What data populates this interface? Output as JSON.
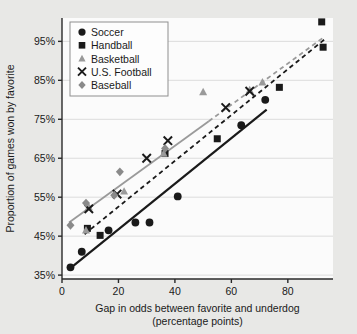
{
  "chart_data": {
    "type": "scatter",
    "title": "",
    "xlabel": "Gap in odds between favorite and underdog (percentage points)",
    "xlabel_line1": "Gap in odds between favorite and underdog",
    "xlabel_line2": "(percentage points)",
    "ylabel": "Proportion of games won by favorite",
    "xlim": [
      0,
      96
    ],
    "ylim": [
      34,
      101
    ],
    "xticks": [
      0,
      20,
      40,
      60,
      80
    ],
    "xtick_labels": [
      "0",
      "20",
      "40",
      "60",
      "80"
    ],
    "yticks": [
      35,
      45,
      55,
      65,
      75,
      85,
      95
    ],
    "ytick_labels": [
      "35%",
      "45%",
      "55%",
      "65%",
      "75%",
      "85%",
      "95%"
    ],
    "grid": "horizontal",
    "legend_position": "top-left",
    "series": [
      {
        "name": "Soccer",
        "marker": "circle",
        "color": "#1a1a1a",
        "points": [
          {
            "x": 3,
            "y": 37
          },
          {
            "x": 7,
            "y": 41
          },
          {
            "x": 16.5,
            "y": 46.5
          },
          {
            "x": 26,
            "y": 48.5
          },
          {
            "x": 31,
            "y": 48.5
          },
          {
            "x": 41,
            "y": 55.2
          },
          {
            "x": 63.5,
            "y": 73.5
          },
          {
            "x": 72,
            "y": 80
          }
        ]
      },
      {
        "name": "Handball",
        "marker": "square",
        "color": "#1a1a1a",
        "points": [
          {
            "x": 9,
            "y": 47
          },
          {
            "x": 13.5,
            "y": 45.2
          },
          {
            "x": 36.5,
            "y": 66.2
          },
          {
            "x": 55,
            "y": 70
          },
          {
            "x": 77,
            "y": 83.2
          },
          {
            "x": 92,
            "y": 100
          },
          {
            "x": 92.5,
            "y": 93.5
          }
        ]
      },
      {
        "name": "Basketball",
        "marker": "triangle",
        "color": "#9a9a9a",
        "points": [
          {
            "x": 8.5,
            "y": 46.5
          },
          {
            "x": 9.5,
            "y": 52.5
          },
          {
            "x": 22,
            "y": 56.5
          },
          {
            "x": 36,
            "y": 66.2
          },
          {
            "x": 50,
            "y": 82
          },
          {
            "x": 66.5,
            "y": 82.5
          },
          {
            "x": 71,
            "y": 84.5
          }
        ]
      },
      {
        "name": "U.S. Football",
        "marker": "cross",
        "color": "#1a1a1a",
        "points": [
          {
            "x": 9.5,
            "y": 52
          },
          {
            "x": 19.5,
            "y": 55.8
          },
          {
            "x": 30,
            "y": 65
          },
          {
            "x": 37.5,
            "y": 69.5
          },
          {
            "x": 58,
            "y": 78
          },
          {
            "x": 66.5,
            "y": 82.2
          }
        ]
      },
      {
        "name": "Baseball",
        "marker": "diamond",
        "color": "#8a8a8a",
        "points": [
          {
            "x": 3,
            "y": 47.8
          },
          {
            "x": 8.5,
            "y": 53.5
          },
          {
            "x": 18.5,
            "y": 55.5
          },
          {
            "x": 20.5,
            "y": 61.5
          },
          {
            "x": 36.5,
            "y": 67.5
          }
        ]
      }
    ],
    "trend_lines": [
      {
        "name": "soccer-trend",
        "style": "solid",
        "color": "#1a1a1a",
        "width": 2.2,
        "x1": 3,
        "y1": 36.8,
        "x2": 72.5,
        "y2": 77.5
      },
      {
        "name": "handball-trend",
        "style": "dashed",
        "color": "#1a1a1a",
        "width": 1.8,
        "x1": 8,
        "y1": 45.5,
        "x2": 93.5,
        "y2": 95.8
      },
      {
        "name": "ballsports-trend",
        "style": "solid",
        "color": "#9a9a9a",
        "width": 1.8,
        "x1": 2.5,
        "y1": 48.5,
        "x2": 52,
        "y2": 74.5
      },
      {
        "name": "ballsports-trend-extension",
        "style": "dashed",
        "color": "#9a9a9a",
        "width": 1.8,
        "x1": 52,
        "y1": 74.5,
        "x2": 93,
        "y2": 96.2
      }
    ]
  },
  "legend": {
    "items": [
      {
        "label": "Soccer",
        "marker": "circle",
        "color": "#1a1a1a"
      },
      {
        "label": "Handball",
        "marker": "square",
        "color": "#1a1a1a"
      },
      {
        "label": "Basketball",
        "marker": "triangle",
        "color": "#9a9a9a"
      },
      {
        "label": "U.S. Football",
        "marker": "cross",
        "color": "#1a1a1a"
      },
      {
        "label": "Baseball",
        "marker": "diamond",
        "color": "#8a8a8a"
      }
    ]
  },
  "colors": {
    "page_background": "#e8e8e6",
    "plot_background": "#fbfbfb",
    "axis": "#2a2a2a",
    "grid": "#dcdcdc",
    "legend_background": "#fdfdfd",
    "legend_border": "#8f8f8f"
  }
}
